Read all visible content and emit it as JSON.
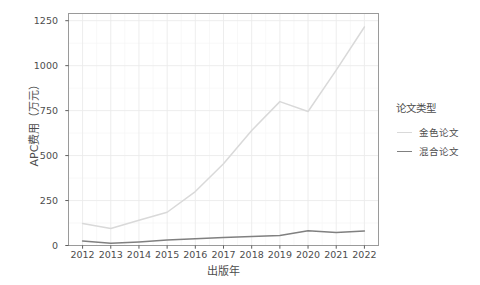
{
  "chart_data": {
    "type": "line",
    "title": "",
    "xlabel": "出版年",
    "ylabel": "APC费用（万元）",
    "legend_title": "论文类型",
    "legend_position": "right",
    "grid": true,
    "categories": [
      "2012",
      "2013",
      "2014",
      "2015",
      "2016",
      "2017",
      "2018",
      "2019",
      "2020",
      "2021",
      "2022"
    ],
    "x": [
      2012,
      2013,
      2014,
      2015,
      2016,
      2017,
      2018,
      2019,
      2020,
      2021,
      2022
    ],
    "xlim": [
      2011.5,
      2022.5
    ],
    "ylim": [
      0,
      1290
    ],
    "yticks": [
      0,
      250,
      500,
      750,
      1000,
      1250
    ],
    "ytick_labels": [
      "0",
      "250",
      "500",
      "750",
      "1000",
      "1250"
    ],
    "series": [
      {
        "name": "金色论文",
        "color": "#d9d9d9",
        "values": [
          122,
          95,
          140,
          185,
          300,
          455,
          640,
          800,
          745,
          975,
          1215
        ]
      },
      {
        "name": "混合论文",
        "color": "#808080",
        "values": [
          25,
          12,
          20,
          30,
          38,
          45,
          50,
          55,
          82,
          72,
          80
        ]
      }
    ]
  },
  "colors": {
    "background": "#ffffff",
    "panel_border": "#9a9a9a",
    "grid_major": "#ebebeb",
    "grid_minor": "#f5f5f5",
    "tick_mark": "#4d4d4d",
    "text": "#4d4d4d",
    "series_gold": "#d9d9d9",
    "series_hybrid": "#808080"
  }
}
